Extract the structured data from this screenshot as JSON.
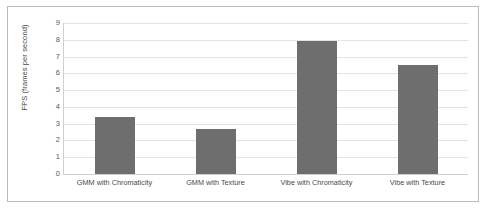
{
  "chart_data": {
    "type": "bar",
    "title": "",
    "xlabel": "",
    "ylabel": "FPS (frames per second)",
    "categories": [
      "GMM with Chromaticity",
      "GMM with Texture",
      "Vibe with Chromaticity",
      "Vibe with Texture"
    ],
    "values": [
      3.4,
      2.7,
      7.9,
      6.5
    ],
    "ylim": [
      0,
      9
    ],
    "yticks": [
      0,
      1,
      2,
      3,
      4,
      5,
      6,
      7,
      8,
      9
    ],
    "ytick_labels": [
      "0",
      "1",
      "2",
      "3",
      "4",
      "5",
      "6",
      "7",
      "8",
      "9"
    ],
    "grid": true,
    "legend": false,
    "bar_color": "#6e6e6e",
    "gridline_color": "#e4e4e4",
    "axis_color": "#cfcfcf",
    "border_color": "#b9b9b9",
    "background_color": "#ffffff"
  }
}
